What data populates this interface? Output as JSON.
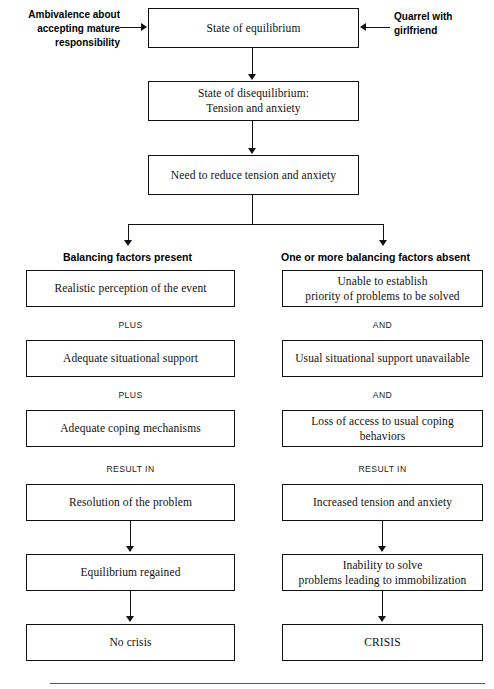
{
  "figure": {
    "type": "flowchart",
    "top_chain": [
      {
        "id": "equilibrium",
        "label": "State of equilibrium"
      },
      {
        "id": "disequilibrium",
        "label": "State of disequilibrium:\nTension and anxiety"
      },
      {
        "id": "need-reduce",
        "label": "Need to reduce tension and anxiety"
      }
    ],
    "side_notes": {
      "left": "Ambivalence about\naccepting mature\nresponsibility",
      "right": "Quarrel with\ngirlfriend"
    },
    "columns": [
      {
        "id": "balancing-present",
        "heading": "Balancing factors present",
        "nodes": [
          {
            "id": "realistic-perception",
            "label": "Realistic perception of the event"
          },
          {
            "id": "adequate-support",
            "label": "Adequate situational support"
          },
          {
            "id": "adequate-coping",
            "label": "Adequate coping mechanisms"
          },
          {
            "id": "resolution",
            "label": "Resolution of the problem"
          },
          {
            "id": "equilibrium-regained",
            "label": "Equilibrium regained"
          },
          {
            "id": "no-crisis",
            "label": "No crisis"
          }
        ],
        "connectors": [
          "PLUS",
          "PLUS",
          "RESULT IN"
        ]
      },
      {
        "id": "balancing-absent",
        "heading": "One or more balancing factors absent",
        "nodes": [
          {
            "id": "unable-establish",
            "label": "Unable to establish\npriority of problems to be solved"
          },
          {
            "id": "support-unavailable",
            "label": "Usual situational support unavailable"
          },
          {
            "id": "loss-coping",
            "label": "Loss of access to usual coping behaviors"
          },
          {
            "id": "increased-tension",
            "label": "Increased tension and anxiety"
          },
          {
            "id": "inability-solve",
            "label": "Inability to solve\nproblems leading to immobilization"
          },
          {
            "id": "crisis",
            "label": "CRISIS"
          }
        ],
        "connectors": [
          "AND",
          "AND",
          "RESULT IN"
        ]
      }
    ],
    "colors": {
      "line": "#111111",
      "box_fill": "#ffffff",
      "box_border": "#111111",
      "shadow": "#bfbfbf",
      "text": "#111111",
      "rule": "#555555"
    }
  }
}
